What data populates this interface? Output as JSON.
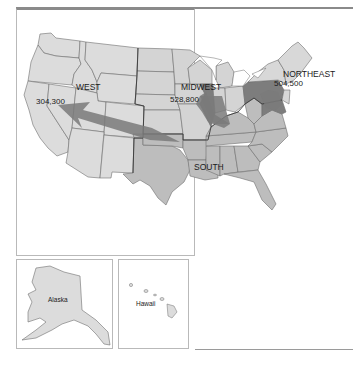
{
  "map": {
    "title": "",
    "regions": [
      {
        "name": "WEST",
        "value": "304,300"
      },
      {
        "name": "MIDWEST",
        "value": "528,800"
      },
      {
        "name": "NORTHEAST",
        "value": "504,500"
      },
      {
        "name": "SOUTH",
        "value": ""
      }
    ],
    "insets": {
      "alaska": "Alaska",
      "hawaii": "Hawaii"
    },
    "colors": {
      "west_fill": "#dcdcdc",
      "midwest_fill": "#d4d4d4",
      "south_fill": "#bdbdbd",
      "northeast_fill": "#d8d8d8",
      "highlight_fill": "#7d7d7d",
      "arrow_fill": "#7a7a7a"
    }
  }
}
